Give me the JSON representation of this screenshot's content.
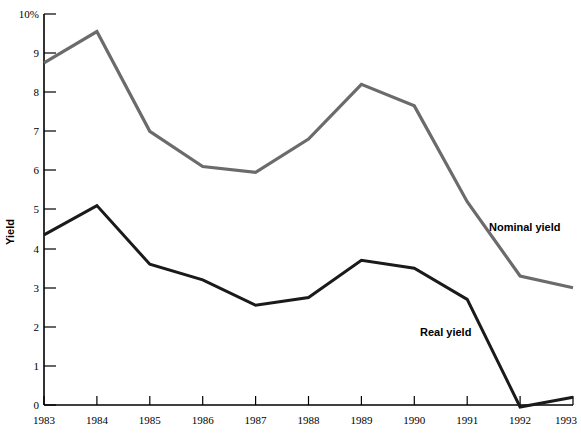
{
  "chart_data": {
    "type": "line",
    "title": "",
    "subtitle": "",
    "xlabel": "",
    "ylabel": "Yield",
    "x": [
      "1983",
      "1984",
      "1985",
      "1986",
      "1987",
      "1988",
      "1989",
      "1990",
      "1991",
      "1992",
      "1993"
    ],
    "xlim": [
      1983,
      1993
    ],
    "ylim": [
      0,
      10
    ],
    "ytick_labels": [
      "0",
      "1",
      "2",
      "3",
      "4",
      "5",
      "6",
      "7",
      "8",
      "9",
      "10%"
    ],
    "ytick_values": [
      0,
      1,
      2,
      3,
      4,
      5,
      6,
      7,
      8,
      9,
      10
    ],
    "grid": false,
    "legend_position": "inline-annotation",
    "series": [
      {
        "name": "Nominal yield",
        "color": "#6b6b6b",
        "values": [
          8.75,
          9.55,
          7.0,
          6.1,
          5.95,
          6.8,
          8.2,
          7.65,
          5.2,
          3.3,
          3.0
        ]
      },
      {
        "name": "Real yield",
        "color": "#1a1a1a",
        "values": [
          4.35,
          5.1,
          3.6,
          3.2,
          2.55,
          2.75,
          3.7,
          3.5,
          2.7,
          -0.05,
          0.2
        ]
      }
    ],
    "annotations": [
      {
        "text": "Nominal yield",
        "x_px": 489,
        "y_px": 231
      },
      {
        "text": "Real yield",
        "x_px": 420,
        "y_px": 336
      }
    ]
  }
}
